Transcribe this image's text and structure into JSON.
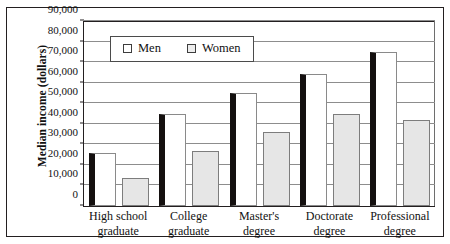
{
  "chart_data": {
    "type": "bar",
    "title": "",
    "xlabel": "",
    "ylabel": "Median income (dollars)",
    "ylim": [
      0,
      90000
    ],
    "yticks": [
      "0",
      "10,000",
      "20,000",
      "30,000",
      "40,000",
      "50,000",
      "60,000",
      "70,000",
      "80,000",
      "90,000"
    ],
    "ytick_values": [
      0,
      10000,
      20000,
      30000,
      40000,
      50000,
      60000,
      70000,
      80000,
      90000
    ],
    "grid": "horizontal",
    "legend_position": "top-left-inside",
    "categories": [
      "High school graduate",
      "College graduate",
      "Master's degree",
      "Doctorate degree",
      "Professional degree"
    ],
    "category_lines": [
      [
        "High school",
        "graduate"
      ],
      [
        "College",
        "graduate"
      ],
      [
        "Master's",
        "degree"
      ],
      [
        "Doctorate",
        "degree"
      ],
      [
        "Professional",
        "degree"
      ]
    ],
    "series": [
      {
        "name": "Men",
        "color": "#ffffff",
        "edge_color": "#14100f",
        "values": [
          26000,
          45000,
          55000,
          64000,
          75000
        ]
      },
      {
        "name": "Women",
        "color": "#e6e6e6",
        "edge_color": "#7d7d7d",
        "values": [
          13500,
          27000,
          36000,
          45000,
          42000
        ]
      }
    ]
  },
  "legend": {
    "items": [
      {
        "label": "Men"
      },
      {
        "label": "Women"
      }
    ]
  }
}
